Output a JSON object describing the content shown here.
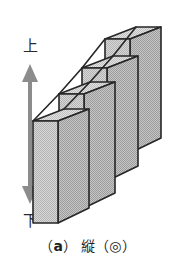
{
  "figure": {
    "caption": {
      "open_paren": "（",
      "letter": "a",
      "close_paren": "）",
      "spacer": " ",
      "text": "縦（◎）",
      "full": "（a）縦（◎）"
    },
    "axis": {
      "up_label": "上",
      "down_label": "下",
      "arrow_type": "double-headed-vertical-arrow",
      "arrow_color": "#8c8c8c"
    },
    "illustration": {
      "type": "isometric-stepped-plates",
      "plate_count": 4,
      "description": "四枚の縦板が階段状に並ぶ立体図",
      "face_fill": "#c9c9c9",
      "side_fill": "#b4b4b4",
      "top_fill": "#d5d5d5",
      "outline": "#262626",
      "plates": [
        {
          "index": 1,
          "position": "front",
          "height_rank": "shortest"
        },
        {
          "index": 2,
          "position": "second",
          "height_rank": "short"
        },
        {
          "index": 3,
          "position": "third",
          "height_rank": "tall"
        },
        {
          "index": 4,
          "position": "back",
          "height_rank": "tallest"
        }
      ]
    }
  }
}
